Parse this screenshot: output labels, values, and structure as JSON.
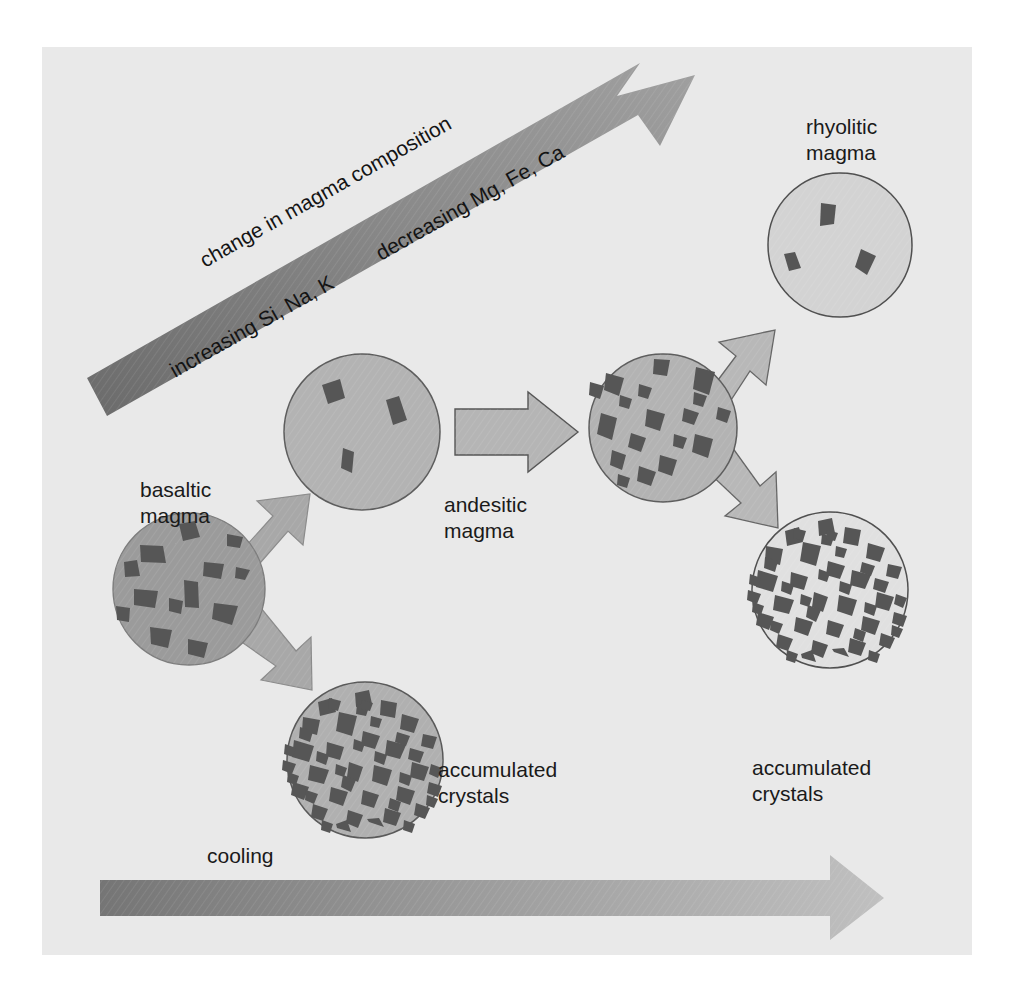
{
  "figure": {
    "background_color": "#e9e9e9",
    "page_color": "#ffffff"
  },
  "labels": {
    "basaltic": "basaltic\nmagma",
    "andesitic": "andesitic\nmagma",
    "rhyolitic": "rhyolitic\nmagma",
    "accumulated_left": "accumulated\ncrystals",
    "accumulated_right": "accumulated\ncrystals",
    "cooling": "cooling"
  },
  "composition_arrow": {
    "line_1": "change in magma composition",
    "line_2a": "increasing Si, Na, K",
    "line_2b": "decreasing Mg, Fe, Ca",
    "color_start": "#6e6e6e",
    "color_end": "#9a9a9a",
    "direction": "up-right"
  },
  "cooling_arrow": {
    "label": "cooling",
    "color_start": "#787878",
    "color_end": "#b9b9b9",
    "direction": "right"
  },
  "nodes": [
    {
      "id": "basaltic-magma",
      "label": "basaltic magma",
      "cx": 189,
      "cy": 589,
      "r": 76,
      "fill": "#9b9b9b",
      "crystal_color": "#565656",
      "crystal_count": 13,
      "description": "dark gray melt with scattered crystals"
    },
    {
      "id": "andesitic-magma",
      "label": "andesitic magma",
      "cx": 362,
      "cy": 432,
      "r": 78,
      "fill": "#b3b3b3",
      "crystal_color": "#565656",
      "crystal_count": 3,
      "description": "lighter melt with few crystals"
    },
    {
      "id": "accumulated-crystals-left",
      "label": "accumulated crystals",
      "cx": 365,
      "cy": 760,
      "r": 78,
      "fill": "#b0b0b0",
      "crystal_color": "#565656",
      "crystal_count": 48,
      "description": "dense angular crystal pile"
    },
    {
      "id": "andesitic-evolved-magma",
      "cx": 663,
      "cy": 428,
      "r": 74,
      "fill": "#b3b3b3",
      "crystal_color": "#565656",
      "crystal_count": 18,
      "description": "medium gray melt with many crystals"
    },
    {
      "id": "rhyolitic-magma",
      "label": "rhyolitic magma",
      "cx": 840,
      "cy": 245,
      "r": 72,
      "fill": "#d3d3d3",
      "crystal_color": "#565656",
      "crystal_count": 3,
      "description": "very light melt, sparse crystals"
    },
    {
      "id": "accumulated-crystals-right",
      "label": "accumulated crystals",
      "cx": 830,
      "cy": 590,
      "r": 78,
      "fill": "#e0e0e0",
      "crystal_color": "#565656",
      "crystal_count": 48,
      "description": "dense angular crystal pile, pale matrix"
    }
  ],
  "connectors": [
    {
      "id": "basalt-to-andesite-up",
      "from": "basaltic-magma",
      "to": "andesitic-magma",
      "style": "block-arrow",
      "fill": "#a8a8a8"
    },
    {
      "id": "basalt-to-accum-down",
      "from": "basaltic-magma",
      "to": "accumulated-crystals-left",
      "style": "block-arrow",
      "fill": "#a8a8a8"
    },
    {
      "id": "andesite-to-evolved",
      "from": "andesitic-magma",
      "to": "andesitic-evolved-magma",
      "style": "outline-arrow",
      "fill": "#b5b5b5"
    },
    {
      "id": "evolved-to-rhyolite-up",
      "from": "andesitic-evolved-magma",
      "to": "rhyolitic-magma",
      "style": "block-arrow",
      "fill": "#b8b8b8"
    },
    {
      "id": "evolved-to-accum-down",
      "from": "andesitic-evolved-magma",
      "to": "accumulated-crystals-right",
      "style": "block-arrow",
      "fill": "#b8b8b8"
    }
  ],
  "crystal_shapes": {
    "basaltic": [
      {
        "x": 186,
        "y": 531,
        "s": 15,
        "rot": 24
      },
      {
        "x": 152,
        "y": 552,
        "s": 19,
        "rot": 110
      },
      {
        "x": 132,
        "y": 567,
        "s": 12,
        "rot": 42
      },
      {
        "x": 213,
        "y": 567,
        "s": 15,
        "rot": 200
      },
      {
        "x": 243,
        "y": 572,
        "s": 11,
        "rot": 305
      },
      {
        "x": 191,
        "y": 592,
        "s": 16,
        "rot": 78
      },
      {
        "x": 146,
        "y": 598,
        "s": 16,
        "rot": 160
      },
      {
        "x": 225,
        "y": 613,
        "s": 17,
        "rot": 20
      },
      {
        "x": 160,
        "y": 637,
        "s": 15,
        "rot": 255
      },
      {
        "x": 197,
        "y": 648,
        "s": 13,
        "rot": 50
      },
      {
        "x": 124,
        "y": 613,
        "s": 11,
        "rot": 130
      },
      {
        "x": 234,
        "y": 540,
        "s": 11,
        "rot": 200
      },
      {
        "x": 176,
        "y": 604,
        "s": 12,
        "rot": 340
      }
    ],
    "andesitic": [
      {
        "x": 330,
        "y": 392,
        "s": 18,
        "rot": 35
      },
      {
        "x": 390,
        "y": 410,
        "s": 18,
        "rot": 118
      },
      {
        "x": 348,
        "y": 459,
        "s": 16,
        "rot": 15
      }
    ],
    "rhyolitic": [
      {
        "x": 828,
        "y": 215,
        "s": 17,
        "rot": 25
      },
      {
        "x": 790,
        "y": 263,
        "s": 15,
        "rot": 45
      },
      {
        "x": 868,
        "y": 262,
        "s": 17,
        "rot": 118
      }
    ]
  }
}
